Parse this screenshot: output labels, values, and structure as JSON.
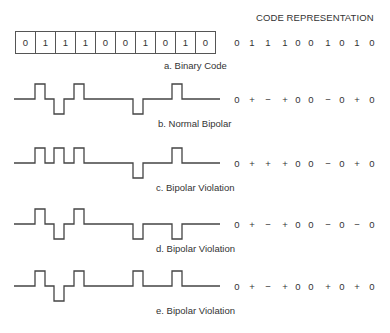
{
  "header": {
    "title": "CODE REPRESENTATION"
  },
  "binary": {
    "bits": [
      "0",
      "1",
      "1",
      "1",
      "0",
      "0",
      "1",
      "0",
      "1",
      "0"
    ],
    "caption": "a. Binary Code",
    "code": [
      "0",
      "1",
      "1",
      "1",
      "0",
      "0",
      "1",
      "0",
      "1",
      "0"
    ]
  },
  "rows": [
    {
      "caption": "b. Normal Bipolar",
      "levels": [
        0,
        1,
        -1,
        1,
        0,
        0,
        -1,
        0,
        1,
        0
      ],
      "code": [
        "0",
        "+",
        "−",
        "+",
        "0",
        "0",
        "−",
        "0",
        "+",
        "0"
      ]
    },
    {
      "caption": "c. Bipolar Violation",
      "levels": [
        0,
        1,
        1,
        1,
        0,
        0,
        -1,
        0,
        1,
        0
      ],
      "code": [
        "0",
        "+",
        "+",
        "+",
        "0",
        "0",
        "−",
        "0",
        "+",
        "0"
      ]
    },
    {
      "caption": "d. Bipolar Violation",
      "levels": [
        0,
        1,
        -1,
        1,
        0,
        0,
        -1,
        0,
        -1,
        0
      ],
      "code": [
        "0",
        "+",
        "−",
        "+",
        "0",
        "0",
        "−",
        "0",
        "−",
        "0"
      ]
    },
    {
      "caption": "e. Bipolar Violation",
      "levels": [
        0,
        1,
        -1,
        1,
        0,
        0,
        1,
        0,
        1,
        0
      ],
      "code": [
        "0",
        "+",
        "−",
        "+",
        "0",
        "0",
        "+",
        "0",
        "+",
        "0"
      ]
    }
  ]
}
